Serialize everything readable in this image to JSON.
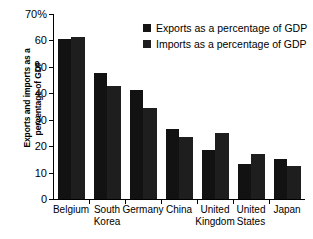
{
  "chart_data": {
    "type": "bar",
    "title": "",
    "xlabel": "",
    "ylabel": "Exports and imports as a percentage of GDP",
    "ylabel_lines": [
      "Exports and imports as a",
      "percentage of GDP"
    ],
    "ylim": [
      0,
      70
    ],
    "ytick_values": [
      0,
      10,
      20,
      30,
      40,
      50,
      60,
      70
    ],
    "ytick_labels": [
      "0",
      "10",
      "20",
      "30",
      "40",
      "50",
      "60",
      "70%"
    ],
    "grid": false,
    "legend_position": "top-right-inside",
    "categories": [
      "Belgium",
      "South Korea",
      "Germany",
      "China",
      "United Kingdom",
      "United States",
      "Japan"
    ],
    "category_labels": [
      "Belgium",
      "South\nKorea",
      "Germany",
      "China",
      "United\nKingdom",
      "United\nStates",
      "Japan"
    ],
    "series": [
      {
        "name": "Exports as a percentage of GDP",
        "color": "#121212",
        "values": [
          60.5,
          47.5,
          41.0,
          26.5,
          18.5,
          13.0,
          15.0
        ]
      },
      {
        "name": "Imports as a percentage of GDP",
        "color": "#1e1e1e",
        "values": [
          61.3,
          42.5,
          34.2,
          23.2,
          24.8,
          16.8,
          12.4
        ]
      }
    ]
  },
  "legend": {
    "items": [
      {
        "label": "Exports as a percentage of GDP"
      },
      {
        "label": "Imports as a percentage of GDP"
      }
    ]
  }
}
